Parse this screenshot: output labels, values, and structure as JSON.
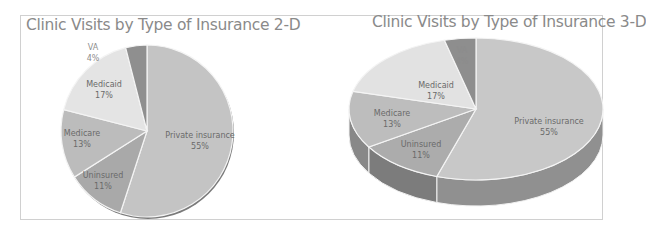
{
  "chart_data": [
    {
      "type": "pie",
      "title": "Clinic Visits by Type of Insurance 2-D",
      "categories": [
        "Private insurance",
        "Uninsured",
        "Medicare",
        "Medicaid",
        "VA"
      ],
      "values": [
        55,
        11,
        13,
        17,
        4
      ],
      "value_labels": [
        "55%",
        "11%",
        "13%",
        "17%",
        "4%"
      ],
      "colors": [
        "#c4c4c4",
        "#a9a9a9",
        "#bcbcbc",
        "#e4e4e4",
        "#8f8f8f"
      ],
      "start_angle_deg": 0,
      "direction": "clockwise",
      "legend": "none (data labels on slices)",
      "style": "2-D"
    },
    {
      "type": "pie",
      "title": "Clinic Visits by Type of Insurance 3-D",
      "categories": [
        "Private insurance",
        "Uninsured",
        "Medicare",
        "Medicaid",
        "VA"
      ],
      "values": [
        55,
        11,
        13,
        17,
        4
      ],
      "value_labels": [
        "55%",
        "11%",
        "13%",
        "17%",
        "4%"
      ],
      "colors": [
        "#c8c8c8",
        "#acacac",
        "#bdbdbd",
        "#e2e2e2",
        "#8e8e8e"
      ],
      "start_angle_deg": 0,
      "direction": "clockwise",
      "legend": "none (data labels on slices)",
      "style": "3-D"
    }
  ],
  "charts": {
    "left": {
      "title": "Clinic Visits by Type of Insurance 2-D",
      "labels": {
        "private": {
          "name": "Private insurance",
          "pct": "55%"
        },
        "uninsured": {
          "name": "Uninsured",
          "pct": "11%"
        },
        "medicare": {
          "name": "Medicare",
          "pct": "13%"
        },
        "medicaid": {
          "name": "Medicaid",
          "pct": "17%"
        },
        "va": {
          "name": "VA",
          "pct": "4%"
        }
      }
    },
    "right": {
      "title": "Clinic Visits by Type of Insurance 3-D",
      "labels": {
        "private": {
          "name": "Private insurance",
          "pct": "55%"
        },
        "uninsured": {
          "name": "Uninsured",
          "pct": "11%"
        },
        "medicare": {
          "name": "Medicare",
          "pct": "13%"
        },
        "medicaid": {
          "name": "Medicaid",
          "pct": "17%"
        },
        "va": {
          "name": "VA",
          "pct": "4%"
        }
      }
    }
  }
}
